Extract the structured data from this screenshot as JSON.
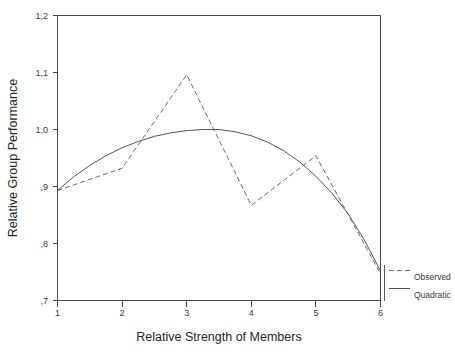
{
  "chart_data": {
    "type": "line",
    "title": "",
    "xlabel": "Relative Strength of Members",
    "ylabel": "Relative Group Performance",
    "xlim": [
      1,
      6
    ],
    "ylim": [
      0.7,
      1.2
    ],
    "grid": false,
    "legend_position": "right",
    "x_ticks": [
      "1",
      "2",
      "3",
      "4",
      "5",
      "6"
    ],
    "x_tick_values": [
      1,
      2,
      3,
      4,
      5,
      6
    ],
    "y_ticks": [
      "1,2",
      "1,1",
      "1,0",
      ",9",
      ",8",
      ",7"
    ],
    "y_tick_values": [
      1.2,
      1.1,
      1.0,
      0.9,
      0.8,
      0.7
    ],
    "x": [
      1,
      2,
      3,
      4,
      5,
      6
    ],
    "series": [
      {
        "name": "Observed",
        "style": "dashed",
        "color": "#6b6b6b",
        "values": [
          0.893,
          0.932,
          1.096,
          0.867,
          0.954,
          0.747
        ]
      },
      {
        "name": "Quadratic",
        "style": "solid",
        "color": "#555555",
        "values": [
          0.893,
          0.968,
          0.998,
          0.999,
          0.944,
          0.752
        ],
        "fit_points": [
          [
            1.0,
            0.893
          ],
          [
            1.25,
            0.917
          ],
          [
            1.5,
            0.937
          ],
          [
            1.75,
            0.954
          ],
          [
            2.0,
            0.968
          ],
          [
            2.25,
            0.979
          ],
          [
            2.5,
            0.988
          ],
          [
            2.75,
            0.994
          ],
          [
            3.0,
            0.998
          ],
          [
            3.25,
            1.0
          ],
          [
            3.5,
            1.0
          ],
          [
            3.75,
            0.996
          ],
          [
            4.0,
            0.989
          ],
          [
            4.25,
            0.978
          ],
          [
            4.5,
            0.963
          ],
          [
            4.75,
            0.943
          ],
          [
            5.0,
            0.918
          ],
          [
            5.25,
            0.888
          ],
          [
            5.5,
            0.852
          ],
          [
            5.75,
            0.806
          ],
          [
            6.0,
            0.752
          ]
        ]
      }
    ],
    "legend_entries": [
      {
        "label": "Observed",
        "style": "dashed"
      },
      {
        "label": "Quadratic",
        "style": "solid"
      }
    ]
  }
}
